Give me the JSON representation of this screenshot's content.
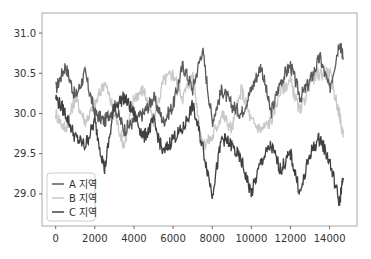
{
  "chart_data": {
    "type": "line",
    "title": "",
    "xlabel": "",
    "ylabel": "",
    "xlim": [
      -700,
      15400
    ],
    "ylim": [
      28.6,
      31.25
    ],
    "grid": false,
    "legend_position": "lower left",
    "x_ticks": [
      "0",
      "2000",
      "4000",
      "6000",
      "8000",
      "10000",
      "12000",
      "14000"
    ],
    "y_ticks": [
      "29.0",
      "29.5",
      "30.0",
      "30.5",
      "31.0"
    ],
    "x": [
      0,
      500,
      1000,
      1500,
      2000,
      2500,
      3000,
      3500,
      4000,
      4500,
      5000,
      5500,
      6000,
      6500,
      7000,
      7500,
      8000,
      8500,
      9000,
      9500,
      10000,
      10500,
      11000,
      11500,
      12000,
      12500,
      13000,
      13500,
      14000,
      14500,
      14700
    ],
    "series": [
      {
        "name": "A 지역",
        "color": "#5a5a5a",
        "values": [
          30.3,
          30.6,
          30.2,
          30.5,
          30.0,
          29.9,
          30.1,
          29.8,
          29.9,
          30.0,
          30.2,
          29.9,
          30.1,
          30.6,
          30.3,
          30.8,
          29.9,
          30.3,
          30.1,
          30.0,
          30.3,
          30.6,
          30.0,
          30.4,
          30.6,
          30.2,
          30.4,
          30.7,
          30.3,
          30.9,
          30.7
        ]
      },
      {
        "name": "B 지역",
        "color": "#c8c8c8",
        "values": [
          30.0,
          29.8,
          30.2,
          29.9,
          30.1,
          30.4,
          30.0,
          29.6,
          30.2,
          30.3,
          29.9,
          30.4,
          30.5,
          30.2,
          30.5,
          29.6,
          29.7,
          30.0,
          29.8,
          30.3,
          29.9,
          29.8,
          29.9,
          30.3,
          30.4,
          30.0,
          30.4,
          30.5,
          30.5,
          30.0,
          29.7
        ]
      },
      {
        "name": "C 지역",
        "color": "#404040",
        "values": [
          30.2,
          30.0,
          29.7,
          29.6,
          29.9,
          29.3,
          30.1,
          30.2,
          30.0,
          29.7,
          29.9,
          29.5,
          29.7,
          29.8,
          30.1,
          29.6,
          29.0,
          29.7,
          29.6,
          29.4,
          29.0,
          29.4,
          29.6,
          29.3,
          29.5,
          29.0,
          29.5,
          29.7,
          29.4,
          28.9,
          29.2
        ]
      }
    ]
  }
}
